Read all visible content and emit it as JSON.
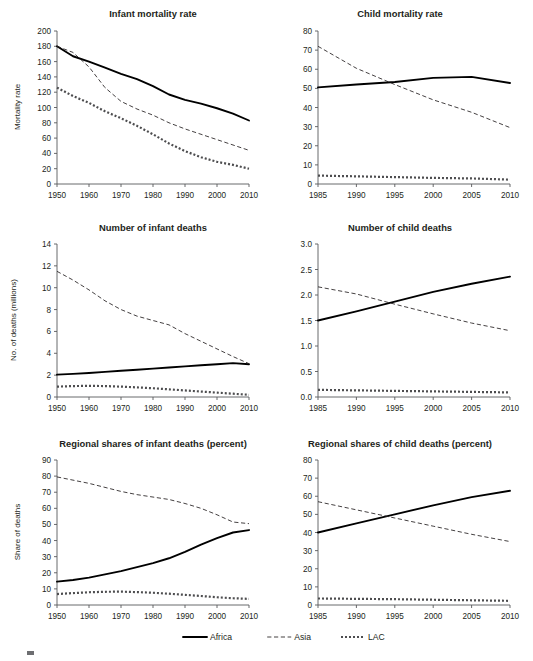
{
  "figure": {
    "legend": {
      "position": "bottom-center",
      "items": [
        {
          "label": "Africa",
          "style": "solid",
          "color": "#000000"
        },
        {
          "label": "Asia",
          "style": "dashed",
          "color": "#231f20"
        },
        {
          "label": "LAC",
          "style": "dotted",
          "color": "#4d4d4f"
        }
      ]
    }
  },
  "chart_data": [
    {
      "id": "infant-mortality-rate",
      "type": "line",
      "title": "Infant mortality rate",
      "xlabel": "",
      "ylabel": "Mortality rate",
      "xlim": [
        1950,
        2010
      ],
      "ylim": [
        0,
        200
      ],
      "xticks": [
        1950,
        1960,
        1970,
        1980,
        1990,
        2000,
        2010
      ],
      "yticks": [
        0,
        20,
        40,
        60,
        80,
        100,
        120,
        140,
        160,
        180,
        200
      ],
      "grid": false,
      "x": [
        1950,
        1955,
        1960,
        1965,
        1970,
        1975,
        1980,
        1985,
        1990,
        1995,
        2000,
        2005,
        2010
      ],
      "series": [
        {
          "name": "Africa",
          "style": "solid",
          "values": [
            180,
            167,
            160,
            152,
            144,
            137,
            128,
            117,
            110,
            105,
            99,
            92,
            83
          ]
        },
        {
          "name": "Asia",
          "style": "dashed",
          "values": [
            180,
            172,
            153,
            126,
            108,
            98,
            90,
            80,
            72,
            65,
            58,
            51,
            44
          ]
        },
        {
          "name": "LAC",
          "style": "dotted",
          "values": [
            126,
            115,
            106,
            95,
            86,
            76,
            65,
            53,
            43,
            35,
            29,
            25,
            20
          ]
        }
      ]
    },
    {
      "id": "child-mortality-rate",
      "type": "line",
      "title": "Child mortality rate",
      "xlabel": "",
      "ylabel": "",
      "xlim": [
        1985,
        2010
      ],
      "ylim": [
        0,
        80
      ],
      "xticks": [
        1985,
        1990,
        1995,
        2000,
        2005,
        2010
      ],
      "yticks": [
        0,
        10,
        20,
        30,
        40,
        50,
        60,
        70,
        80
      ],
      "grid": false,
      "x": [
        1985,
        1990,
        1995,
        2000,
        2005,
        2010
      ],
      "series": [
        {
          "name": "Africa",
          "style": "solid",
          "values": [
            50.5,
            52.0,
            53.3,
            55.5,
            56.0,
            52.8
          ]
        },
        {
          "name": "Asia",
          "style": "dashed",
          "values": [
            72.0,
            60.5,
            52.0,
            44.0,
            37.5,
            29.5
          ]
        },
        {
          "name": "LAC",
          "style": "dotted",
          "values": [
            4.4,
            4.0,
            3.6,
            3.2,
            2.9,
            2.3
          ]
        }
      ]
    },
    {
      "id": "number-of-infant-deaths",
      "type": "line",
      "title": "Number of infant deaths",
      "xlabel": "",
      "ylabel": "No. of deaths (millions)",
      "xlim": [
        1950,
        2010
      ],
      "ylim": [
        0,
        14
      ],
      "xticks": [
        1950,
        1960,
        1970,
        1980,
        1990,
        2000,
        2010
      ],
      "yticks": [
        0,
        2,
        4,
        6,
        8,
        10,
        12,
        14
      ],
      "grid": false,
      "x": [
        1950,
        1955,
        1960,
        1965,
        1970,
        1975,
        1980,
        1985,
        1990,
        1995,
        2000,
        2005,
        2010
      ],
      "series": [
        {
          "name": "Africa",
          "style": "solid",
          "values": [
            2.05,
            2.12,
            2.2,
            2.3,
            2.4,
            2.5,
            2.6,
            2.7,
            2.8,
            2.9,
            3.0,
            3.1,
            3.0
          ]
        },
        {
          "name": "Asia",
          "style": "dashed",
          "values": [
            11.5,
            10.7,
            9.8,
            8.8,
            8.0,
            7.4,
            7.0,
            6.6,
            5.8,
            5.1,
            4.4,
            3.7,
            3.05
          ]
        },
        {
          "name": "LAC",
          "style": "dotted",
          "values": [
            0.95,
            1.0,
            1.02,
            1.0,
            0.95,
            0.88,
            0.8,
            0.7,
            0.6,
            0.5,
            0.4,
            0.3,
            0.2
          ]
        }
      ]
    },
    {
      "id": "number-of-child-deaths",
      "type": "line",
      "title": "Number of child deaths",
      "xlabel": "",
      "ylabel": "",
      "xlim": [
        1985,
        2010
      ],
      "ylim": [
        0.0,
        3.0
      ],
      "xticks": [
        1985,
        1990,
        1995,
        2000,
        2005,
        2010
      ],
      "yticks": [
        0.0,
        0.5,
        1.0,
        1.5,
        2.0,
        2.5,
        3.0
      ],
      "ytick_labels": [
        "0.0",
        "0.5",
        "1.0",
        "1.5",
        "2.0",
        "2.5",
        "3.0"
      ],
      "grid": false,
      "x": [
        1985,
        1990,
        1995,
        2000,
        2005,
        2010
      ],
      "series": [
        {
          "name": "Africa",
          "style": "solid",
          "values": [
            1.5,
            1.68,
            1.87,
            2.06,
            2.22,
            2.36
          ]
        },
        {
          "name": "Asia",
          "style": "dashed",
          "values": [
            2.16,
            2.02,
            1.82,
            1.63,
            1.45,
            1.3
          ]
        },
        {
          "name": "LAC",
          "style": "dotted",
          "values": [
            0.14,
            0.13,
            0.12,
            0.11,
            0.1,
            0.09
          ]
        }
      ]
    },
    {
      "id": "regional-shares-infant-deaths",
      "type": "line",
      "title": "Regional shares of infant deaths (percent)",
      "xlabel": "",
      "ylabel": "Share of deaths",
      "xlim": [
        1950,
        2010
      ],
      "ylim": [
        0,
        90
      ],
      "xticks": [
        1950,
        1960,
        1970,
        1980,
        1990,
        2000,
        2010
      ],
      "yticks": [
        0,
        10,
        20,
        30,
        40,
        50,
        60,
        70,
        80,
        90
      ],
      "grid": false,
      "x": [
        1950,
        1955,
        1960,
        1965,
        1970,
        1975,
        1980,
        1985,
        1990,
        1995,
        2000,
        2005,
        2010
      ],
      "series": [
        {
          "name": "Africa",
          "style": "solid",
          "values": [
            14.5,
            15.5,
            17.0,
            19.0,
            21.0,
            23.5,
            26.0,
            29.0,
            33.0,
            37.5,
            41.5,
            45.0,
            46.5
          ]
        },
        {
          "name": "Asia",
          "style": "dashed",
          "values": [
            79.5,
            77.5,
            75.5,
            73.0,
            70.5,
            68.5,
            67.0,
            65.5,
            63.0,
            60.0,
            56.0,
            51.5,
            50.5
          ]
        },
        {
          "name": "LAC",
          "style": "dotted",
          "values": [
            6.8,
            7.4,
            7.9,
            8.2,
            8.3,
            8.0,
            7.6,
            7.0,
            6.3,
            5.6,
            4.8,
            4.2,
            3.8
          ]
        }
      ]
    },
    {
      "id": "regional-shares-child-deaths",
      "type": "line",
      "title": "Regional shares of child deaths (percent)",
      "xlabel": "",
      "ylabel": "",
      "xlim": [
        1985,
        2010
      ],
      "ylim": [
        0,
        80
      ],
      "xticks": [
        1985,
        1990,
        1995,
        2000,
        2005,
        2010
      ],
      "yticks": [
        0,
        10,
        20,
        30,
        40,
        50,
        60,
        70,
        80
      ],
      "grid": false,
      "x": [
        1985,
        1990,
        1995,
        2000,
        2005,
        2010
      ],
      "series": [
        {
          "name": "Africa",
          "style": "solid",
          "values": [
            40.0,
            45.0,
            50.0,
            55.0,
            59.5,
            63.0
          ]
        },
        {
          "name": "Asia",
          "style": "dashed",
          "values": [
            57.0,
            52.5,
            48.0,
            43.5,
            39.0,
            35.0
          ]
        },
        {
          "name": "LAC",
          "style": "dotted",
          "values": [
            3.6,
            3.4,
            3.2,
            2.9,
            2.6,
            2.3
          ]
        }
      ]
    }
  ],
  "layout": {
    "panels": [
      {
        "chart": 0,
        "x": 57,
        "y": 31,
        "w": 192,
        "h": 153,
        "title_x": 153,
        "title_y": 17,
        "ylabel_x": 20,
        "ylabel_y": 107
      },
      {
        "chart": 1,
        "x": 318,
        "y": 31,
        "w": 192,
        "h": 153,
        "title_x": 400,
        "title_y": 17,
        "ylabel_x": 0,
        "ylabel_y": 0
      },
      {
        "chart": 2,
        "x": 57,
        "y": 244,
        "w": 192,
        "h": 153,
        "title_x": 153,
        "title_y": 231,
        "ylabel_x": 16,
        "ylabel_y": 320
      },
      {
        "chart": 3,
        "x": 318,
        "y": 244,
        "w": 192,
        "h": 153,
        "title_x": 400,
        "title_y": 231,
        "ylabel_x": 0,
        "ylabel_y": 0
      },
      {
        "chart": 4,
        "x": 57,
        "y": 460,
        "w": 192,
        "h": 145,
        "title_x": 153,
        "title_y": 447,
        "ylabel_x": 20,
        "ylabel_y": 532
      },
      {
        "chart": 5,
        "x": 318,
        "y": 460,
        "w": 192,
        "h": 145,
        "title_x": 400,
        "title_y": 447,
        "ylabel_x": 0,
        "ylabel_y": 0
      }
    ]
  }
}
